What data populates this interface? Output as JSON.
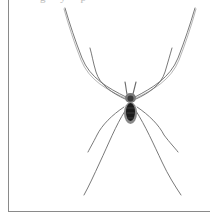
{
  "figure": {
    "caption_fragment": "g y p",
    "colors": {
      "background": "#ffffff",
      "frame": "#8a8a8a",
      "legs": "#6a6a6a",
      "body_dark": "#1a1a1a",
      "body_mid": "#7a7a7a"
    }
  }
}
